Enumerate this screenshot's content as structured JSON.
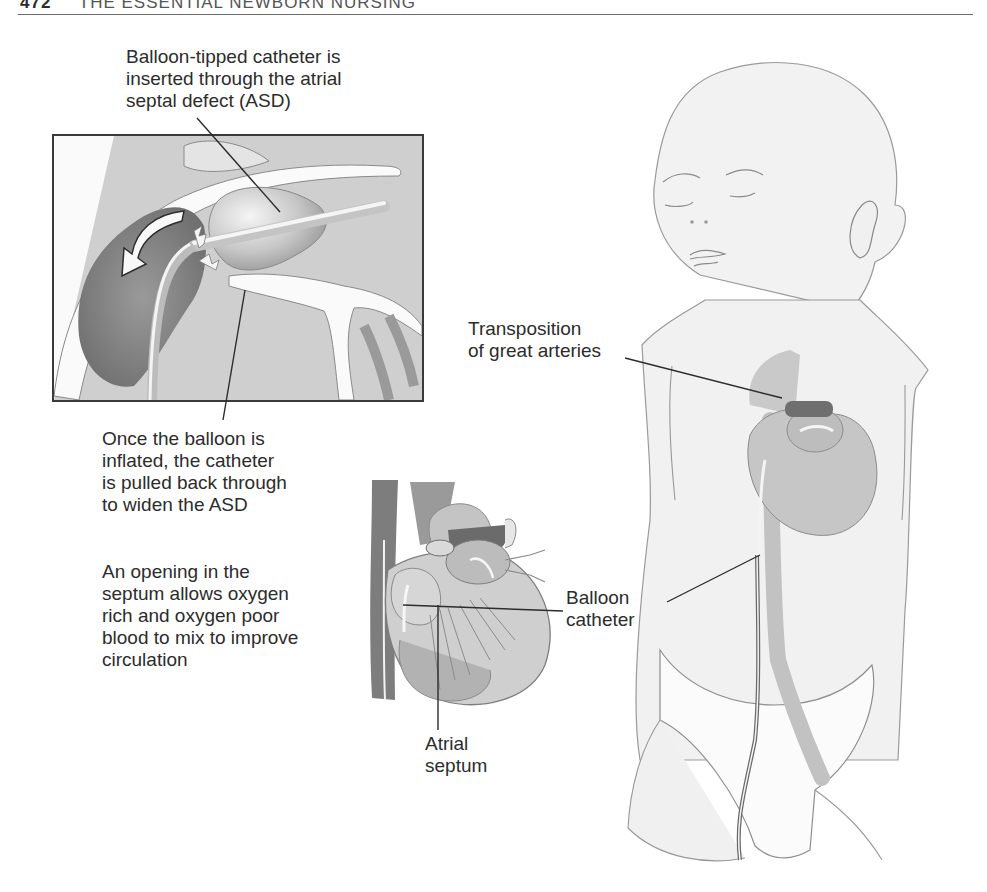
{
  "page": {
    "running_head": {
      "page_number": "472",
      "title": "THE ESSENTIAL NEWBORN NURSING"
    }
  },
  "figure": {
    "inset": {
      "caption_top": "Balloon-tipped catheter is\ninserted through the atrial\nseptal defect (ASD)",
      "caption_bottom": "Once the balloon is\ninflated, the catheter\nis pulled back through\nto widen the ASD"
    },
    "heart_detail": {
      "description": "An opening in the\nseptum allows oxygen\nrich and oxygen poor\nblood to mix to improve\ncirculation",
      "label_catheter": "Balloon\ncatheter",
      "label_septum": "Atrial\nseptum"
    },
    "infant": {
      "label_transposition": "Transposition\nof great arteries"
    },
    "colors": {
      "ink": "#2c2c2c",
      "frame": "#3a3a3a",
      "tissue_light": "#d8d8d8",
      "tissue_mid": "#b4b4b4",
      "tissue_dark": "#7a7a7a",
      "skin": "#f1f1f1",
      "outline": "#8a8a8a"
    }
  }
}
